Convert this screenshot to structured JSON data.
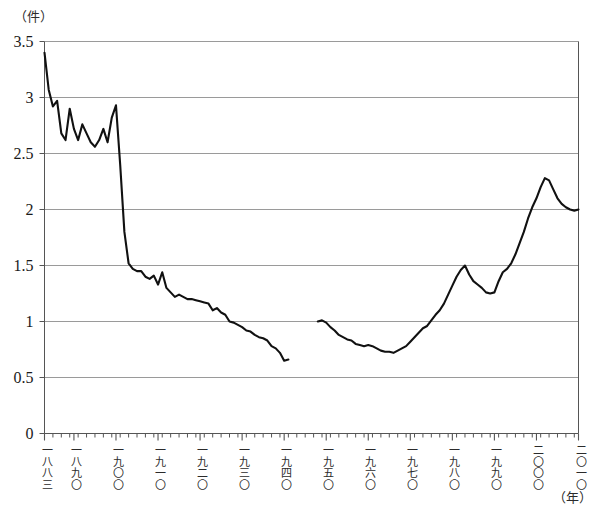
{
  "chart_data": {
    "type": "line",
    "title": "",
    "subtitle": "",
    "xlabel": "年",
    "ylabel": "件",
    "y_unit_label": "（件）",
    "x_unit_label": "（年）",
    "xlim": [
      1883,
      2010
    ],
    "ylim": [
      0,
      3.5
    ],
    "grid": "horizontal",
    "legend": "none",
    "y_ticks": [
      0,
      0.5,
      1,
      1.5,
      2,
      2.5,
      3,
      3.5
    ],
    "y_tick_labels": [
      "0",
      "0.5",
      "1",
      "1.5",
      "2",
      "2.5",
      "3",
      "3.5"
    ],
    "x_major_ticks": [
      1883,
      1890,
      1900,
      1910,
      1920,
      1930,
      1940,
      1950,
      1960,
      1970,
      1980,
      1990,
      2000,
      2010
    ],
    "x_tick_labels": [
      "一八八三",
      "一八九〇",
      "一九〇〇",
      "一九一〇",
      "一九二〇",
      "一九三〇",
      "一九四〇",
      "一九五〇",
      "一九六〇",
      "一九七〇",
      "一九八〇",
      "一九九〇",
      "二〇〇〇",
      "二〇一〇"
    ],
    "x_minor_tick_interval": 2,
    "line_color": "#111111",
    "grid_color": "#9a9a9a",
    "axis_color": "#555555",
    "series": [
      {
        "name": "segment-1",
        "x": [
          1883,
          1884,
          1885,
          1886,
          1887,
          1888,
          1889,
          1890,
          1891,
          1892,
          1893,
          1894,
          1895,
          1896,
          1897,
          1898,
          1899,
          1900,
          1901,
          1902,
          1903,
          1904,
          1905,
          1906,
          1907,
          1908,
          1909,
          1910,
          1911,
          1912,
          1913,
          1914,
          1915,
          1916,
          1917,
          1918,
          1919,
          1920,
          1921,
          1922,
          1923,
          1924,
          1925,
          1926,
          1927,
          1928,
          1929,
          1930,
          1931,
          1932,
          1933,
          1934,
          1935,
          1936,
          1937,
          1938,
          1939,
          1940,
          1941
        ],
        "values": [
          3.4,
          3.07,
          2.92,
          2.97,
          2.68,
          2.62,
          2.9,
          2.72,
          2.62,
          2.76,
          2.68,
          2.6,
          2.56,
          2.62,
          2.72,
          2.6,
          2.82,
          2.93,
          2.4,
          1.8,
          1.52,
          1.47,
          1.45,
          1.45,
          1.4,
          1.38,
          1.41,
          1.33,
          1.44,
          1.3,
          1.26,
          1.22,
          1.24,
          1.22,
          1.2,
          1.2,
          1.19,
          1.18,
          1.17,
          1.16,
          1.1,
          1.12,
          1.08,
          1.06,
          1.0,
          0.99,
          0.97,
          0.95,
          0.92,
          0.91,
          0.88,
          0.86,
          0.85,
          0.83,
          0.78,
          0.76,
          0.72,
          0.65,
          0.66
        ]
      },
      {
        "name": "segment-2",
        "x": [
          1948,
          1949,
          1950,
          1951,
          1952,
          1953,
          1954,
          1955,
          1956,
          1957,
          1958,
          1959,
          1960,
          1961,
          1962,
          1963,
          1964,
          1965,
          1966,
          1967,
          1968,
          1969,
          1970,
          1971,
          1972,
          1973,
          1974,
          1975,
          1976,
          1977,
          1978,
          1979,
          1980,
          1981,
          1982,
          1983,
          1984,
          1985,
          1986,
          1987,
          1988,
          1989,
          1990,
          1991,
          1992,
          1993,
          1994,
          1995,
          1996,
          1997,
          1998,
          1999,
          2000,
          2001,
          2002,
          2003,
          2004,
          2005,
          2006,
          2007,
          2008,
          2009,
          2010
        ],
        "values": [
          1.0,
          1.01,
          0.99,
          0.95,
          0.92,
          0.88,
          0.86,
          0.84,
          0.83,
          0.8,
          0.79,
          0.78,
          0.79,
          0.78,
          0.76,
          0.74,
          0.73,
          0.73,
          0.72,
          0.74,
          0.76,
          0.78,
          0.82,
          0.86,
          0.9,
          0.94,
          0.96,
          1.01,
          1.06,
          1.1,
          1.16,
          1.24,
          1.32,
          1.4,
          1.46,
          1.5,
          1.42,
          1.36,
          1.33,
          1.3,
          1.26,
          1.25,
          1.26,
          1.36,
          1.44,
          1.47,
          1.52,
          1.6,
          1.7,
          1.8,
          1.92,
          2.02,
          2.1,
          2.2,
          2.28,
          2.26,
          2.18,
          2.1,
          2.05,
          2.02,
          2.0,
          1.99,
          2.0
        ]
      }
    ],
    "gap": {
      "from": 1941,
      "to": 1948
    }
  }
}
